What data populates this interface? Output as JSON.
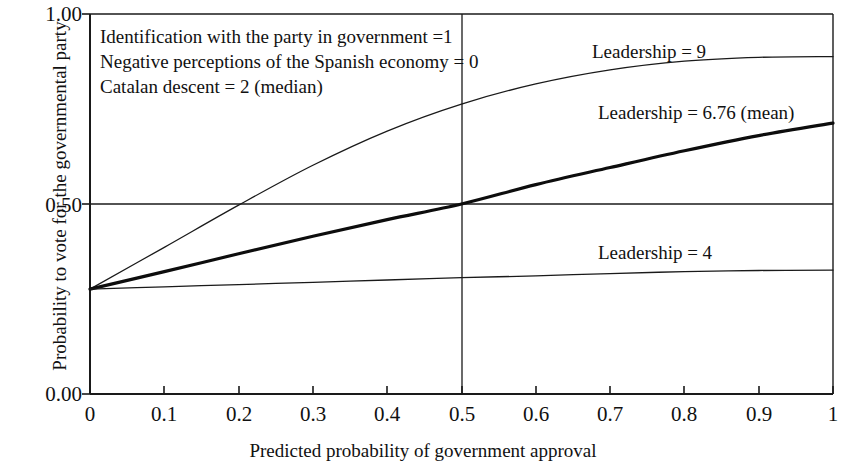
{
  "chart_data": {
    "type": "line",
    "title": "",
    "xlabel": "Predicted probability of government approval",
    "ylabel": "Probability to vote for the governmental party",
    "xlim": [
      0,
      1
    ],
    "ylim": [
      0,
      1
    ],
    "grid": false,
    "xticks": [
      "0",
      "0.1",
      "0.2",
      "0.3",
      "0.4",
      "0.5",
      "0.6",
      "0.7",
      "0.8",
      "0.9",
      "1"
    ],
    "yticks": [
      "0.00",
      "0.50",
      "1.00"
    ],
    "legend_position": "inline-right",
    "reference_lines": [
      {
        "axis": "y",
        "value": 0.5
      },
      {
        "axis": "x",
        "value": 0.5
      }
    ],
    "annotations": [
      "Identification with the party in government =1",
      "Negative perceptions of the Spanish economy = 0",
      "Catalan descent = 2  (median)"
    ],
    "x": [
      0,
      0.1,
      0.2,
      0.3,
      0.4,
      0.5,
      0.6,
      0.7,
      0.8,
      0.9,
      1
    ],
    "series": [
      {
        "name": "Leadership = 9",
        "color": "#1a1a1a",
        "width": 1.3,
        "values": [
          0.276,
          0.386,
          0.497,
          0.602,
          0.692,
          0.763,
          0.816,
          0.853,
          0.876,
          0.886,
          0.888
        ]
      },
      {
        "name": "Leadership = 6.76 (mean)",
        "color": "#0d0d0d",
        "width": 3.2,
        "values": [
          0.276,
          0.322,
          0.369,
          0.415,
          0.459,
          0.5,
          0.551,
          0.596,
          0.64,
          0.68,
          0.713
        ]
      },
      {
        "name": "Leadership = 4",
        "color": "#1a1a1a",
        "width": 1.3,
        "values": [
          0.276,
          0.282,
          0.288,
          0.294,
          0.3,
          0.306,
          0.311,
          0.317,
          0.322,
          0.325,
          0.326
        ]
      }
    ]
  },
  "labels": {
    "series_0": "Leadership = 9",
    "series_1": "Leadership = 6.76 (mean)",
    "series_2": "Leadership = 4",
    "annotation_0": "Identification with the party in government =1",
    "annotation_1": "Negative perceptions of the Spanish economy = 0",
    "annotation_2": "Catalan descent = 2  (median)",
    "ytick_0": "1.00",
    "ytick_1": "0.50",
    "ytick_2": "0.00",
    "xtick_0": "0",
    "xtick_1": "0.1",
    "xtick_2": "0.2",
    "xtick_3": "0.3",
    "xtick_4": "0.4",
    "xtick_5": "0.5",
    "xtick_6": "0.6",
    "xtick_7": "0.7",
    "xtick_8": "0.8",
    "xtick_9": "0.9",
    "xtick_10": "1",
    "x_axis_title": "Predicted probability of government approval",
    "y_axis_title": "Probability to vote for the governmental party"
  }
}
